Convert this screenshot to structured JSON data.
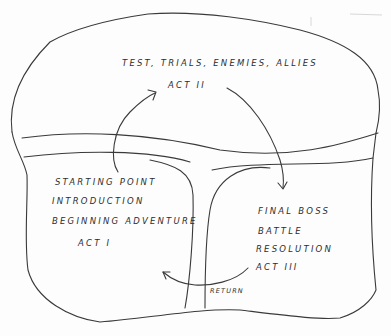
{
  "diagram": {
    "type": "hand-drawn story structure sketch",
    "act2": {
      "description": "TEST, TRIALS, ENEMIES, ALLIES",
      "label": "ACT II"
    },
    "act1": {
      "line1": "STARTING POINT",
      "line2": "INTRODUCTION",
      "line3": "BEGINNING ADVENTURE",
      "label": "ACT I"
    },
    "act3": {
      "line1": "FINAL BOSS",
      "line2": "BATTLE",
      "line3": "RESOLUTION",
      "label": "ACT III"
    },
    "return_label": "RETURN",
    "stroke_color": "#3a3a3a"
  }
}
